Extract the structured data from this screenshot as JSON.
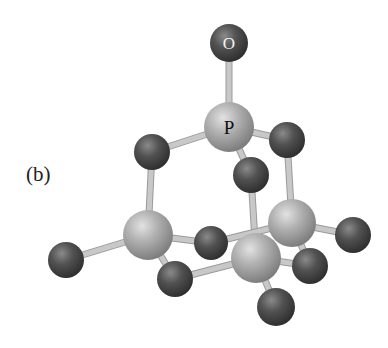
{
  "figure": {
    "panel_label": "(b)",
    "molecule": "P4O10",
    "colors": {
      "background": "#ffffff",
      "phosphorus": "#a9a9a9",
      "oxygen": "#4a4a4a",
      "bond": "#c8c8c8"
    },
    "atom_labels": {
      "oxygen_top": "O",
      "phosphorus_top": "P"
    },
    "atoms": [
      {
        "id": "O1",
        "element": "O",
        "x": 229,
        "y": 43,
        "r": 19,
        "label": "O"
      },
      {
        "id": "P1",
        "element": "P",
        "x": 229,
        "y": 127,
        "r": 25,
        "label": "P"
      },
      {
        "id": "O2",
        "element": "O",
        "x": 152,
        "y": 152,
        "r": 18
      },
      {
        "id": "O3",
        "element": "O",
        "x": 287,
        "y": 140,
        "r": 18
      },
      {
        "id": "O4",
        "element": "O",
        "x": 251,
        "y": 175,
        "r": 18
      },
      {
        "id": "P2",
        "element": "P",
        "x": 148,
        "y": 235,
        "r": 25
      },
      {
        "id": "P3",
        "element": "P",
        "x": 292,
        "y": 223,
        "r": 24
      },
      {
        "id": "P4",
        "element": "P",
        "x": 256,
        "y": 258,
        "r": 25
      },
      {
        "id": "O5",
        "element": "O",
        "x": 66,
        "y": 260,
        "r": 18
      },
      {
        "id": "O6",
        "element": "O",
        "x": 211,
        "y": 243,
        "r": 17
      },
      {
        "id": "O7",
        "element": "O",
        "x": 175,
        "y": 279,
        "r": 18
      },
      {
        "id": "O8",
        "element": "O",
        "x": 353,
        "y": 235,
        "r": 18
      },
      {
        "id": "O9",
        "element": "O",
        "x": 310,
        "y": 266,
        "r": 18
      },
      {
        "id": "O10",
        "element": "O",
        "x": 276,
        "y": 307,
        "r": 19
      }
    ],
    "bonds": [
      [
        "O1",
        "P1"
      ],
      [
        "P1",
        "O2"
      ],
      [
        "P1",
        "O3"
      ],
      [
        "P1",
        "O4"
      ],
      [
        "O2",
        "P2"
      ],
      [
        "O3",
        "P3"
      ],
      [
        "O4",
        "P4"
      ],
      [
        "P2",
        "O5"
      ],
      [
        "P2",
        "O6"
      ],
      [
        "P2",
        "O7"
      ],
      [
        "O6",
        "P3"
      ],
      [
        "O7",
        "P4"
      ],
      [
        "P3",
        "O8"
      ],
      [
        "P3",
        "O9"
      ],
      [
        "O9",
        "P4"
      ],
      [
        "P4",
        "O10"
      ]
    ]
  }
}
